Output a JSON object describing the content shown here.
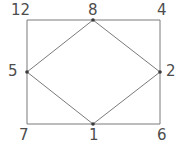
{
  "figure": {
    "background_color": "#ffffff",
    "line_color": "#7a7a7a",
    "vertex_dot_color": "#3a3a3a",
    "label_color": "#4d4d4d",
    "width": 186,
    "height": 152
  },
  "nodes": [
    {
      "id": "n12",
      "label": "12",
      "role": "rectangle-corner",
      "position": "top-left",
      "x": 27,
      "y": 20
    },
    {
      "id": "n8",
      "label": "8",
      "role": "diamond-vertex",
      "position": "top-middle",
      "x": 93,
      "y": 20
    },
    {
      "id": "n4",
      "label": "4",
      "role": "rectangle-corner",
      "position": "top-right",
      "x": 160,
      "y": 20
    },
    {
      "id": "n5",
      "label": "5",
      "role": "diamond-vertex",
      "position": "left-middle",
      "x": 27,
      "y": 72
    },
    {
      "id": "n2",
      "label": "2",
      "role": "diamond-vertex",
      "position": "right-middle",
      "x": 160,
      "y": 72
    },
    {
      "id": "n7",
      "label": "7",
      "role": "rectangle-corner",
      "position": "bottom-left",
      "x": 27,
      "y": 124
    },
    {
      "id": "n1",
      "label": "1",
      "role": "diamond-vertex",
      "position": "bottom-middle",
      "x": 93,
      "y": 124
    },
    {
      "id": "n6",
      "label": "6",
      "role": "rectangle-corner",
      "position": "bottom-right",
      "x": 160,
      "y": 124
    }
  ],
  "edges": [
    {
      "from": "n12",
      "to": "n4",
      "shape": "rectangle-top"
    },
    {
      "from": "n4",
      "to": "n6",
      "shape": "rectangle-right"
    },
    {
      "from": "n6",
      "to": "n7",
      "shape": "rectangle-bottom"
    },
    {
      "from": "n7",
      "to": "n12",
      "shape": "rectangle-left"
    },
    {
      "from": "n8",
      "to": "n2",
      "shape": "diamond-upper-right"
    },
    {
      "from": "n2",
      "to": "n1",
      "shape": "diamond-lower-right"
    },
    {
      "from": "n1",
      "to": "n5",
      "shape": "diamond-lower-left"
    },
    {
      "from": "n5",
      "to": "n8",
      "shape": "diamond-upper-left"
    }
  ]
}
